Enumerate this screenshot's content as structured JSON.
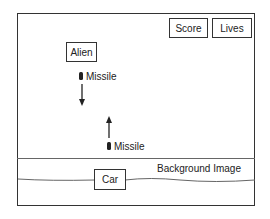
{
  "diagram": {
    "title": "",
    "hud": {
      "score_label": "Score",
      "lives_label": "Lives"
    },
    "alien": {
      "label": "Alien"
    },
    "alien_missile": {
      "label": "Missile",
      "direction": "down"
    },
    "player_missile": {
      "label": "Missile",
      "direction": "up"
    },
    "background": {
      "label": "Background Image"
    },
    "car": {
      "label": "Car"
    },
    "colors": {
      "stroke": "#333333",
      "background": "#ffffff",
      "ground_line": "#666666"
    }
  }
}
